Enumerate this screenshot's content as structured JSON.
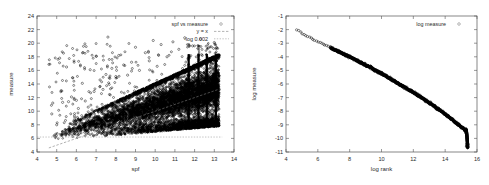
{
  "figure": {
    "panel_count": 2,
    "background": "#ffffff",
    "point_color": "#000000",
    "line_color": "#8a8a8a"
  },
  "chart_data": [
    {
      "type": "scatter",
      "title": "",
      "panel": "left",
      "xlabel": "spf",
      "ylabel": "measure",
      "xlim": [
        4,
        14
      ],
      "ylim": [
        4,
        24
      ],
      "xticks": [
        4,
        5,
        6,
        7,
        8,
        9,
        10,
        11,
        12,
        13,
        14
      ],
      "yticks": [
        4,
        6,
        8,
        10,
        12,
        14,
        16,
        18,
        20,
        22,
        24
      ],
      "xtick_labels": [
        "4",
        "5",
        "6",
        "7",
        "8",
        "9",
        "10",
        "11",
        "12",
        "13",
        "14"
      ],
      "ytick_labels": [
        "4",
        "6",
        "8",
        "10",
        "12",
        "14",
        "16",
        "18",
        "20",
        "22",
        "24"
      ],
      "grid": false,
      "legend_position": "top-right",
      "legend": [
        {
          "label": "spf vs measure",
          "marker": "open-circle",
          "style": "points"
        },
        {
          "label": "y = x",
          "marker": "dashed-line",
          "style": "line"
        },
        {
          "label": "-log 0.002",
          "marker": "dotted-line",
          "style": "line"
        }
      ],
      "series": [
        {
          "name": "spf vs measure",
          "style": "points",
          "marker": "open-circle",
          "description": "Dense wedge-shaped point cloud widening and rising with spf; sparse outliers at low spf reaching measure 16-21; saturated vertical bands at high spf.",
          "point_count_approx": 40000,
          "cloud": {
            "x_start": 4.6,
            "x_end": 13.25,
            "lower_edge_at_x_start": 5.4,
            "lower_edge_at_x_end": 7.6,
            "upper_edge_at_x_start": 7.0,
            "upper_edge_at_x_end": 18.4,
            "core_slope": 1.05
          },
          "vertical_bands_x": [
            11.7,
            12.2,
            12.62,
            13.08
          ],
          "vertical_band_y_range": [
            7.7,
            18.4
          ],
          "outliers": [
            [
              4.75,
              9.6
            ],
            [
              4.8,
              11.2
            ],
            [
              5.0,
              8.0
            ],
            [
              5.15,
              17.8
            ],
            [
              5.3,
              11.3
            ],
            [
              5.5,
              16.5
            ],
            [
              5.6,
              11.4
            ],
            [
              5.75,
              12.1
            ],
            [
              5.9,
              9.3
            ],
            [
              6.0,
              11.6
            ],
            [
              6.1,
              10.4
            ],
            [
              6.3,
              14.1
            ],
            [
              6.45,
              11.5
            ],
            [
              6.6,
              10.6
            ],
            [
              6.7,
              16.1
            ],
            [
              6.9,
              12.9
            ],
            [
              7.0,
              18.1
            ],
            [
              7.2,
              14.6
            ],
            [
              7.35,
              13.2
            ],
            [
              7.5,
              15.4
            ],
            [
              7.6,
              20.9
            ],
            [
              7.8,
              16.3
            ],
            [
              8.0,
              15.1
            ],
            [
              8.15,
              18.2
            ],
            [
              8.4,
              16.8
            ],
            [
              8.6,
              15.3
            ],
            [
              8.8,
              17.2
            ],
            [
              9.0,
              19.4
            ],
            [
              9.2,
              16.0
            ],
            [
              9.5,
              18.6
            ],
            [
              9.7,
              17.4
            ],
            [
              9.9,
              20.4
            ],
            [
              10.1,
              16.6
            ],
            [
              10.3,
              19.8
            ],
            [
              10.6,
              18.0
            ],
            [
              10.9,
              20.2
            ],
            [
              11.2,
              19.1
            ],
            [
              11.5,
              20.8
            ],
            [
              11.9,
              19.6
            ],
            [
              12.3,
              20.6
            ],
            [
              12.7,
              19.3
            ],
            [
              13.0,
              20.1
            ]
          ]
        },
        {
          "name": "y = x",
          "style": "line",
          "line_style": "dashed",
          "points": [
            [
              4.6,
              4.6
            ],
            [
              13.3,
              13.3
            ]
          ]
        },
        {
          "name": "-log 0.002",
          "style": "line",
          "line_style": "dotted",
          "constant_y": 6.2,
          "points": [
            [
              4.0,
              6.2
            ],
            [
              13.4,
              6.2
            ]
          ]
        }
      ]
    },
    {
      "type": "scatter",
      "title": "",
      "panel": "right",
      "xlabel": "log rank",
      "ylabel": "log measure",
      "xlim": [
        4,
        16
      ],
      "ylim": [
        -11,
        -1
      ],
      "xticks": [
        4,
        6,
        8,
        10,
        12,
        14,
        16
      ],
      "yticks": [
        -11,
        -10,
        -9,
        -8,
        -7,
        -6,
        -5,
        -4,
        -3,
        -2,
        -1
      ],
      "xtick_labels": [
        "4",
        "6",
        "8",
        "10",
        "12",
        "14",
        "16"
      ],
      "ytick_labels": [
        "-11",
        "-10",
        "-9",
        "-8",
        "-7",
        "-6",
        "-5",
        "-4",
        "-3",
        "-2",
        "-1"
      ],
      "grid": false,
      "legend_position": "top-right",
      "legend": [
        {
          "label": "log measure",
          "marker": "open-circle",
          "style": "points"
        }
      ],
      "series": [
        {
          "name": "log measure",
          "style": "points",
          "marker": "open-circle",
          "description": "Zipf-like rank/measure curve: sparse discrete points at low rank, then a thick continuous near-linear band decreasing to a sharp cliff at the right edge.",
          "points": [
            [
              4.7,
              -2.0
            ],
            [
              4.85,
              -2.12
            ],
            [
              5.05,
              -2.3
            ],
            [
              5.25,
              -2.46
            ],
            [
              5.55,
              -2.62
            ],
            [
              5.85,
              -2.82
            ],
            [
              6.05,
              -2.92
            ],
            [
              6.3,
              -3.05
            ],
            [
              6.55,
              -3.18
            ],
            [
              6.8,
              -3.32
            ],
            [
              7.0,
              -3.45
            ],
            [
              7.3,
              -3.6
            ],
            [
              7.6,
              -3.78
            ],
            [
              8.0,
              -4.0
            ],
            [
              8.4,
              -4.24
            ],
            [
              8.8,
              -4.48
            ],
            [
              9.2,
              -4.72
            ],
            [
              9.6,
              -4.98
            ],
            [
              10.0,
              -5.24
            ],
            [
              10.4,
              -5.5
            ],
            [
              10.8,
              -5.78
            ],
            [
              11.2,
              -6.06
            ],
            [
              11.6,
              -6.34
            ],
            [
              12.0,
              -6.62
            ],
            [
              12.4,
              -6.92
            ],
            [
              12.8,
              -7.22
            ],
            [
              13.2,
              -7.54
            ],
            [
              13.6,
              -7.88
            ],
            [
              14.0,
              -8.22
            ],
            [
              14.4,
              -8.58
            ],
            [
              14.7,
              -8.86
            ],
            [
              15.0,
              -9.14
            ],
            [
              15.2,
              -9.32
            ],
            [
              15.32,
              -9.6
            ],
            [
              15.38,
              -10.0
            ],
            [
              15.4,
              -10.3
            ]
          ],
          "band_halfwidth": 0.12,
          "sparse_until_x": 7.0,
          "cliff_x": 15.3,
          "cliff_y_from": -9.3,
          "cliff_y_to": -10.35
        }
      ]
    }
  ]
}
